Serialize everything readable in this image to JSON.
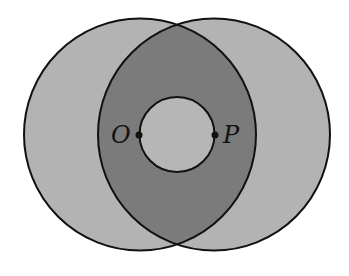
{
  "diagram": {
    "type": "geometry",
    "colors": {
      "background": "#ffffff",
      "outer_fill": "#b3b3b3",
      "lens_fill": "#7b7b7b",
      "inner_fill": "#b6b6b6",
      "stroke": "#111111"
    },
    "circles": [
      {
        "name": "circle-O",
        "cx": 140,
        "cy": 134.5,
        "r": 116
      },
      {
        "name": "circle-P",
        "cx": 214,
        "cy": 134.5,
        "r": 116
      },
      {
        "name": "circle-OP",
        "cx": 177,
        "cy": 134.5,
        "r": 37.5
      }
    ],
    "points": [
      {
        "label": "O",
        "x": 139,
        "y": 135
      },
      {
        "label": "P",
        "x": 215,
        "y": 135
      }
    ]
  }
}
